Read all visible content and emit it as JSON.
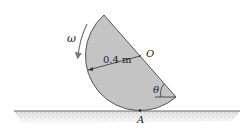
{
  "diagram": {
    "labels": {
      "omega": "ω",
      "radius": "0.4 m",
      "center": "O",
      "angle": "θ",
      "contact_point": "A"
    },
    "colors": {
      "disk_fill": "#c4c4c4",
      "disk_edge": "#555555",
      "ground_line": "#6a6a6a",
      "ground_hatch": "#cfcfcf",
      "arrow": "#777777",
      "text": "#222222"
    }
  }
}
